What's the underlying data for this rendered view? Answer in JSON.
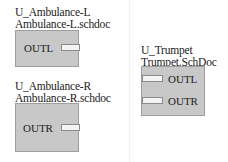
{
  "sheets": [
    {
      "designator": "U_Ambulance-L",
      "filename": "Ambulance-L.schdoc",
      "ports": [
        {
          "name": "OUTL",
          "side": "right"
        }
      ]
    },
    {
      "designator": "U_Ambulance-R",
      "filename": "Ambulance-R.schdoc",
      "ports": [
        {
          "name": "OUTR",
          "side": "right"
        }
      ]
    },
    {
      "designator": "U_Trumpet",
      "filename": "Trumpet.SchDoc",
      "ports": [
        {
          "name": "OUTL",
          "side": "left"
        },
        {
          "name": "OUTR",
          "side": "left"
        }
      ]
    }
  ],
  "colors": {
    "sheet_fill": "#c8c8c8",
    "sheet_border": "#9e9e9e",
    "port_fill": "#f4f4f4"
  }
}
